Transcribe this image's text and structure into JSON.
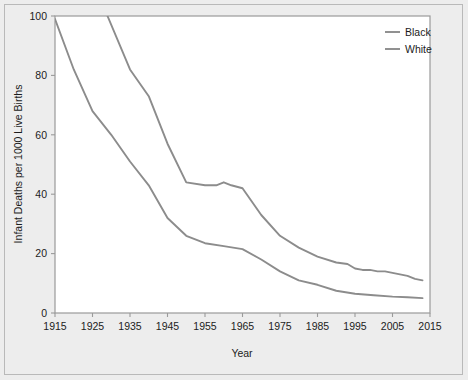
{
  "chart_data": {
    "type": "line",
    "title": "",
    "xlabel": "Year",
    "ylabel": "Infant Deaths per 1000 Live Births",
    "xlim": [
      1915,
      2015
    ],
    "ylim": [
      0,
      100
    ],
    "xticks": [
      1915,
      1925,
      1935,
      1945,
      1955,
      1965,
      1975,
      1985,
      1995,
      2005,
      2015
    ],
    "yticks": [
      0,
      20,
      40,
      60,
      80,
      100
    ],
    "grid": false,
    "legend_position": "top-right",
    "series": [
      {
        "name": "Black",
        "color": "#8c8c8c",
        "note": "values before 1930 exceed the y-axis maximum and are clipped",
        "x": [
          1929,
          1935,
          1940,
          1945,
          1950,
          1955,
          1958,
          1960,
          1962,
          1965,
          1970,
          1975,
          1980,
          1985,
          1990,
          1993,
          1995,
          1997,
          1999,
          2001,
          2003,
          2005,
          2007,
          2009,
          2011,
          2013
        ],
        "values": [
          100,
          82,
          73,
          57,
          44,
          43,
          43,
          44,
          43,
          42,
          33,
          26,
          22,
          19,
          17,
          16.5,
          15,
          14.5,
          14.5,
          14,
          14,
          13.5,
          13,
          12.5,
          11.5,
          11
        ]
      },
      {
        "name": "White",
        "color": "#8c8c8c",
        "x": [
          1915,
          1920,
          1925,
          1930,
          1935,
          1940,
          1945,
          1950,
          1955,
          1960,
          1965,
          1970,
          1975,
          1980,
          1985,
          1990,
          1995,
          2000,
          2005,
          2009,
          2013
        ],
        "values": [
          99,
          82,
          68,
          60,
          51,
          43,
          32,
          26,
          23.5,
          22.5,
          21.5,
          18,
          14,
          11,
          9.5,
          7.5,
          6.5,
          6,
          5.5,
          5.3,
          5
        ]
      }
    ]
  },
  "legend": {
    "items": [
      {
        "label": "Black"
      },
      {
        "label": "White"
      }
    ]
  },
  "axes": {
    "x_title": "Year",
    "y_title": "Infant Deaths per 1000 Live Births",
    "x_tick_labels": [
      "1915",
      "1925",
      "1935",
      "1945",
      "1955",
      "1965",
      "1975",
      "1985",
      "1995",
      "2005",
      "2015"
    ],
    "y_tick_labels": [
      "0",
      "20",
      "40",
      "60",
      "80",
      "100"
    ]
  },
  "colors": {
    "line": "#8c8c8c",
    "frame": "#9a9a9a",
    "figure_bg": "#ededed",
    "plot_bg": "#ffffff",
    "text": "#1c1c1c"
  }
}
